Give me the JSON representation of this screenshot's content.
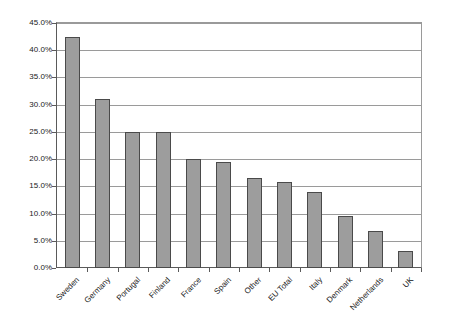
{
  "chart_data": {
    "type": "bar",
    "title": "",
    "subtitle": "",
    "xlabel": "",
    "ylabel": "",
    "ylim": [
      0,
      45
    ],
    "yticks": [
      "0.0%",
      "5.0%",
      "10.0%",
      "15.0%",
      "20.0%",
      "25.0%",
      "30.0%",
      "35.0%",
      "40.0%",
      "45.0%"
    ],
    "ytick_values": [
      0,
      5,
      10,
      15,
      20,
      25,
      30,
      35,
      40,
      45
    ],
    "grid": true,
    "legend": "none",
    "categories": [
      "Sweden",
      "Germany",
      "Portugal",
      "Finland",
      "France",
      "Spain",
      "Other",
      "EU Total",
      "Italy",
      "Denmark",
      "Netherlands",
      "UK"
    ],
    "values": [
      42.5,
      31.0,
      25.0,
      25.0,
      20.0,
      19.5,
      16.5,
      15.8,
      14.0,
      9.5,
      6.8,
      3.2
    ],
    "value_labels": [
      "42.5%",
      "31.0%",
      "25.0%",
      "25.0%",
      "20.0%",
      "19.5%",
      "16.5%",
      "15.8%",
      "14.0%",
      "9.5%",
      "6.8%",
      "3.2%"
    ],
    "series": [
      {
        "name": "",
        "values": [
          42.5,
          31.0,
          25.0,
          25.0,
          20.0,
          19.5,
          16.5,
          15.8,
          14.0,
          9.5,
          6.8,
          3.2
        ]
      }
    ],
    "colors": {
      "bar_fill": "#9d9d9d",
      "bar_border": "#4a4a4a",
      "gridline": "#9a9a9a",
      "axis": "#5a5a5a",
      "text": "#1a1a1a",
      "background": "#ffffff"
    }
  }
}
